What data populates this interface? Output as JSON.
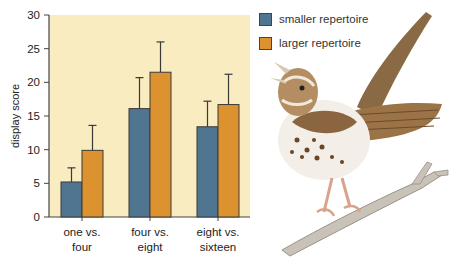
{
  "chart_data": {
    "type": "bar",
    "title": "",
    "xlabel": "",
    "ylabel": "display score",
    "ylim": [
      0,
      30
    ],
    "yticks": [
      0,
      5,
      10,
      15,
      20,
      25,
      30
    ],
    "grid": false,
    "legend_position": "right",
    "background": "#f8ecc0",
    "categories": [
      [
        "one vs.",
        "four"
      ],
      [
        "four vs.",
        "eight"
      ],
      [
        "eight vs.",
        "sixteen"
      ]
    ],
    "series": [
      {
        "name": "smaller repertoire",
        "color": "#4f7591",
        "values": [
          5.2,
          16.1,
          13.4
        ],
        "error_upper": [
          7.3,
          20.7,
          17.2
        ]
      },
      {
        "name": "larger repertoire",
        "color": "#dc922e",
        "values": [
          9.9,
          21.5,
          16.7
        ],
        "error_upper": [
          13.6,
          26.0,
          21.2
        ]
      }
    ]
  },
  "legend": {
    "items": [
      {
        "label": "smaller repertoire",
        "color": "#4f7591"
      },
      {
        "label": "larger repertoire",
        "color": "#dc922e"
      }
    ]
  },
  "illustration": {
    "subject": "song sparrow perched on a branch, singing"
  }
}
